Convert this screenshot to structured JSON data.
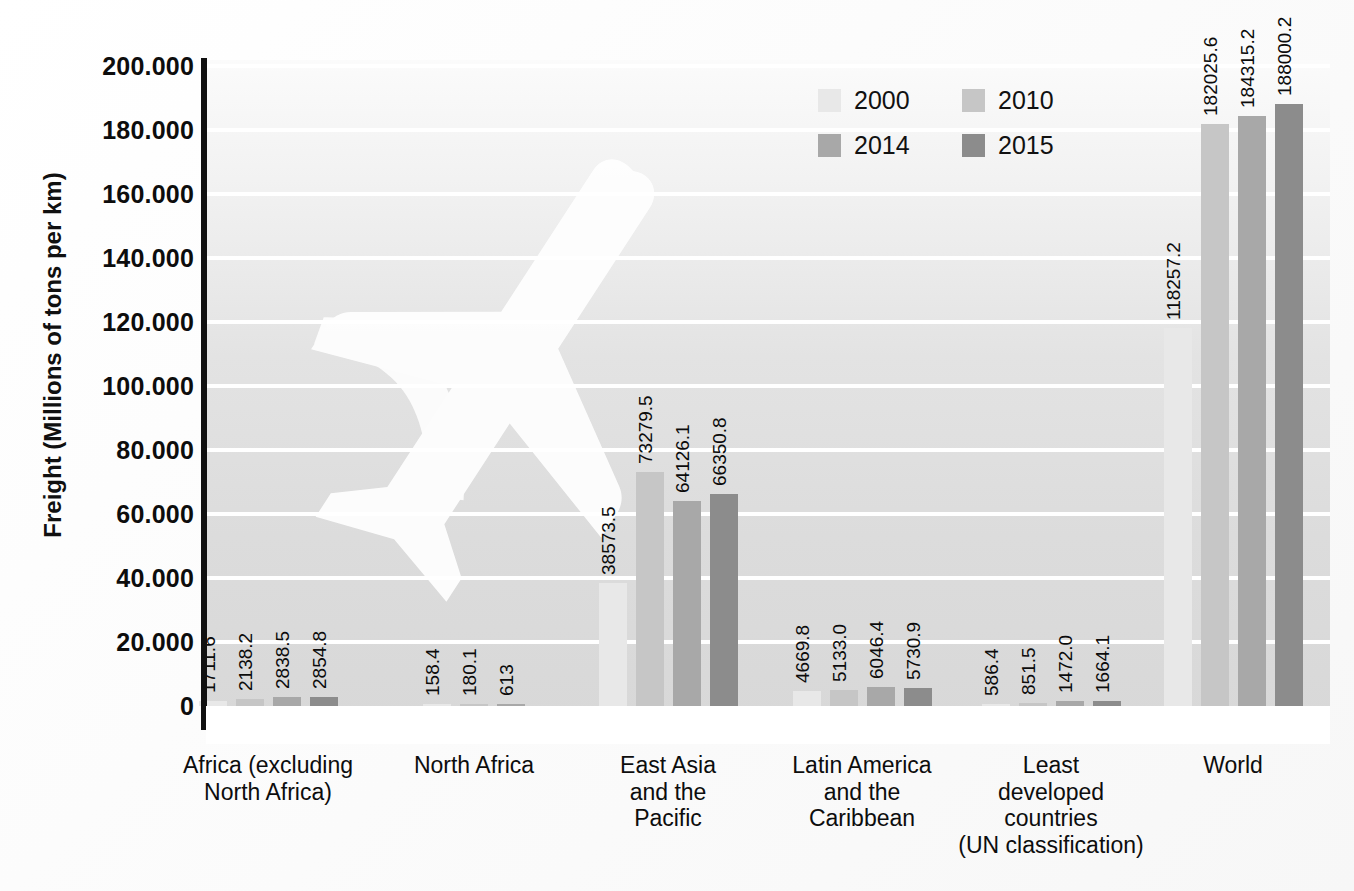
{
  "chart_data": {
    "type": "bar",
    "title": "",
    "subtitle": "",
    "xlabel": "",
    "ylabel": "Freight (Millions of tons per km)",
    "ylim": [
      0,
      200000
    ],
    "ytick_labels": [
      "200.000",
      "180.000",
      "160.000",
      "140.000",
      "120.000",
      "100.000",
      "80.000",
      "60.000",
      "40.000",
      "20.000",
      "0"
    ],
    "ytick_values": [
      200000,
      180000,
      160000,
      140000,
      120000,
      100000,
      80000,
      60000,
      40000,
      20000,
      0
    ],
    "grid": true,
    "legend_position": "top-right",
    "categories": [
      "Africa (excluding North Africa)",
      "North Africa",
      "East Asia and the Pacific",
      "Latin America and the Caribbean",
      "Least developed countries (UN classification)",
      "World"
    ],
    "category_lines": [
      [
        "Africa (excluding",
        "North Africa)"
      ],
      [
        "North Africa"
      ],
      [
        "East Asia",
        "and the",
        "Pacific"
      ],
      [
        "Latin America",
        "and the",
        "Caribbean"
      ],
      [
        "Least",
        "developed",
        "countries",
        "(UN classification)"
      ],
      [
        "World"
      ]
    ],
    "series": [
      {
        "name": "2000",
        "color": "#e8e8e8",
        "values": [
          1711.6,
          158.4,
          38573.5,
          4669.8,
          586.4,
          118257.2
        ],
        "labels": [
          "1711.6",
          "158.4",
          "38573.5",
          "4669.8",
          "586.4",
          "118257.2"
        ]
      },
      {
        "name": "2010",
        "color": "#c6c6c6",
        "values": [
          2138.2,
          180.1,
          73279.5,
          5133.0,
          851.5,
          182025.6
        ],
        "labels": [
          "2138.2",
          "180.1",
          "73279.5",
          "5133.0",
          "851.5",
          "182025.6"
        ]
      },
      {
        "name": "2014",
        "color": "#a8a8a8",
        "values": [
          2838.5,
          613,
          64126.1,
          6046.4,
          1472.0,
          184315.2
        ],
        "labels": [
          "2838.5",
          "613",
          "64126.1",
          "6046.4",
          "1472.0",
          "184315.2"
        ]
      },
      {
        "name": "2015",
        "color": "#8c8c8c",
        "values": [
          2854.8,
          null,
          66350.8,
          5730.9,
          1664.1,
          188000.2
        ],
        "labels": [
          "2854.8",
          "",
          "66350.8",
          "5730.9",
          "1664.1",
          "188000.2"
        ]
      }
    ]
  },
  "legend": {
    "items": [
      {
        "label": "2000",
        "color": "#e8e8e8"
      },
      {
        "label": "2010",
        "color": "#c6c6c6"
      },
      {
        "label": "2014",
        "color": "#a8a8a8"
      },
      {
        "label": "2015",
        "color": "#8c8c8c"
      }
    ]
  },
  "decor": {
    "watermark": "airplane-silhouette"
  }
}
